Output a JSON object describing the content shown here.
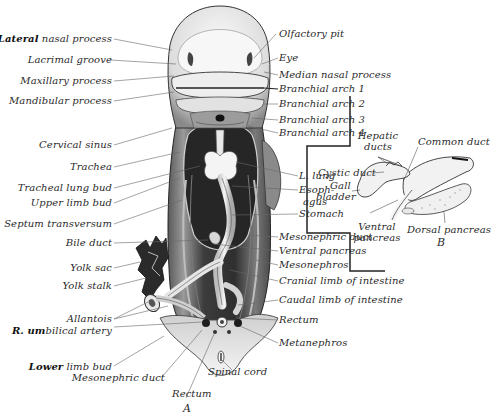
{
  "figure": {
    "panels": [
      {
        "id": "A",
        "caption": "A",
        "subject": "human embryo, ventral view with body wall removed"
      },
      {
        "id": "B",
        "caption": "B",
        "subject": "developing liver ducts and pancreas"
      }
    ]
  },
  "labels_left": [
    {
      "bold": "Lateral",
      "text": " nasal process"
    },
    {
      "bold": "",
      "text": "Lacrimal groove"
    },
    {
      "bold": "",
      "text": "Maxillary process"
    },
    {
      "bold": "",
      "text": "Mandibular process"
    },
    {
      "bold": "",
      "text": "Cervical sinus"
    },
    {
      "bold": "",
      "text": "Trachea"
    },
    {
      "bold": "",
      "text": "Tracheal lung bud"
    },
    {
      "bold": "",
      "text": "Upper limb bud"
    },
    {
      "bold": "",
      "text": "Septum transversum"
    },
    {
      "bold": "",
      "text": "Bile duct"
    },
    {
      "bold": "",
      "text": "Yolk sac"
    },
    {
      "bold": "",
      "text": "Yolk stalk"
    },
    {
      "bold": "",
      "text": "Allantois"
    },
    {
      "bold": "R. um",
      "text": "bilical artery"
    },
    {
      "bold": "Lower",
      "text": " limb bud"
    },
    {
      "bold": "",
      "text": "Mesonephric duct"
    }
  ],
  "labels_right": [
    {
      "text": "Olfactory pit"
    },
    {
      "text": "Eye"
    },
    {
      "text": "Median nasal process"
    },
    {
      "text": "Branchial arch 1"
    },
    {
      "text": "Branchial arch 2"
    },
    {
      "text": "Branchial arch 3"
    },
    {
      "text": "Branchial arch 4"
    },
    {
      "text": "L. lung"
    },
    {
      "text": "Esoph-"
    },
    {
      "text": "agus"
    },
    {
      "text": "Stomach"
    },
    {
      "text": "Mesonephric duct"
    },
    {
      "text": "Ventral pancreas"
    },
    {
      "text": "Mesonephros"
    },
    {
      "text": "Cranial limb of intestine"
    },
    {
      "text": "Caudal limb of intestine"
    },
    {
      "text": "Rectum"
    },
    {
      "text": "Metanephros"
    }
  ],
  "labels_bottom": [
    {
      "text": "Spinal cord"
    },
    {
      "text": "Rectum"
    }
  ],
  "labels_inset_B": [
    {
      "text": "Hepatic"
    },
    {
      "text": "ducts"
    },
    {
      "text": "Common duct"
    },
    {
      "text": "Cystic duct"
    },
    {
      "text": "Gall"
    },
    {
      "text": "bladder"
    },
    {
      "text": "Ventral"
    },
    {
      "text": "pancreas"
    },
    {
      "text": "Dorsal pancreas"
    },
    {
      "text": "Stomach"
    }
  ],
  "colors": {
    "background": "#ffffff",
    "ink": "#2a2a2a",
    "embryo_dark": "#3a3a3a",
    "embryo_light": "#e8e8e8"
  }
}
